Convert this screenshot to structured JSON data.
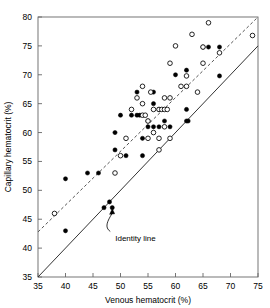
{
  "chart_data": {
    "type": "scatter",
    "title": "",
    "xlabel": "Venous hematocrit (%)",
    "ylabel": "Capillary hematocrit (%)",
    "xlim": [
      35,
      75
    ],
    "ylim": [
      35,
      80
    ],
    "xticks": [
      35,
      40,
      45,
      50,
      55,
      60,
      65,
      70,
      75
    ],
    "yticks": [
      35,
      40,
      45,
      50,
      55,
      60,
      65,
      70,
      75,
      80
    ],
    "grid": false,
    "legend": null,
    "series": [
      {
        "name": "closed-circles",
        "marker": "filled-circle",
        "color": "#000000",
        "points": [
          [
            40,
            52
          ],
          [
            40,
            43
          ],
          [
            44,
            53
          ],
          [
            46,
            53
          ],
          [
            47,
            47
          ],
          [
            48,
            48
          ],
          [
            48.5,
            47
          ],
          [
            49,
            60
          ],
          [
            49,
            57
          ],
          [
            50,
            63
          ],
          [
            51,
            56
          ],
          [
            52,
            63
          ],
          [
            53,
            63
          ],
          [
            53,
            67
          ],
          [
            53.5,
            63
          ],
          [
            54,
            56
          ],
          [
            54,
            59
          ],
          [
            55,
            62
          ],
          [
            55,
            61
          ],
          [
            56,
            67
          ],
          [
            56,
            61
          ],
          [
            56,
            65
          ],
          [
            57,
            61
          ],
          [
            57,
            64
          ],
          [
            58,
            62
          ],
          [
            59,
            61
          ],
          [
            60,
            70
          ],
          [
            62,
            64
          ],
          [
            62,
            70.8
          ],
          [
            62,
            62
          ],
          [
            62.3,
            62
          ],
          [
            65,
            74.8
          ],
          [
            66,
            74.8
          ],
          [
            68,
            69.8
          ],
          [
            68,
            74.8
          ]
        ]
      },
      {
        "name": "open-circles",
        "marker": "open-circle",
        "color": "#000000",
        "points": [
          [
            38,
            46
          ],
          [
            49,
            53
          ],
          [
            50,
            56
          ],
          [
            51,
            59
          ],
          [
            52,
            64
          ],
          [
            53,
            66
          ],
          [
            54,
            68
          ],
          [
            54,
            65
          ],
          [
            54,
            63
          ],
          [
            54.5,
            63
          ],
          [
            55,
            62
          ],
          [
            55,
            59
          ],
          [
            55.5,
            67
          ],
          [
            56,
            64
          ],
          [
            56,
            60
          ],
          [
            57,
            64
          ],
          [
            57,
            59
          ],
          [
            57,
            57
          ],
          [
            57.5,
            64
          ],
          [
            58,
            66
          ],
          [
            58,
            64
          ],
          [
            58,
            61
          ],
          [
            58.5,
            64
          ],
          [
            59,
            59
          ],
          [
            59,
            72
          ],
          [
            59,
            66
          ],
          [
            60,
            75
          ],
          [
            61,
            68
          ],
          [
            62,
            68
          ],
          [
            62,
            69.8
          ],
          [
            63,
            77
          ],
          [
            64,
            67
          ],
          [
            65,
            72
          ],
          [
            65,
            74.8
          ],
          [
            66,
            79
          ],
          [
            68,
            73.8
          ],
          [
            74,
            76.8
          ]
        ]
      }
    ],
    "lines": [
      {
        "name": "regression-line",
        "style": "dashed",
        "color": "#555555",
        "from": [
          35,
          42.8
        ],
        "to": [
          75,
          80
        ]
      },
      {
        "name": "identity-line",
        "style": "solid",
        "color": "#333333",
        "from": [
          35,
          35
        ],
        "to": [
          75,
          75
        ]
      }
    ],
    "annotations": [
      {
        "name": "identity-line-annotation",
        "text": "Identity line",
        "text_xy": [
          48.5,
          41.5
        ],
        "arrow_to": [
          48.5,
          46.9
        ]
      }
    ]
  },
  "axes": {
    "x_label": "Venous hematocrit (%)",
    "y_label": "Capillary hematocrit (%)",
    "x_ticks": [
      "35",
      "40",
      "45",
      "50",
      "55",
      "60",
      "65",
      "70",
      "75"
    ],
    "y_ticks": [
      "35",
      "40",
      "45",
      "50",
      "55",
      "60",
      "65",
      "70",
      "75",
      "80"
    ]
  },
  "annotation": {
    "identity_line_text": "Identity line"
  },
  "colors": {
    "marker_fill": "#000000",
    "marker_stroke": "#000000",
    "regression_line": "#555555",
    "identity_line": "#333333",
    "axis": "#666666",
    "background": "#ffffff"
  }
}
